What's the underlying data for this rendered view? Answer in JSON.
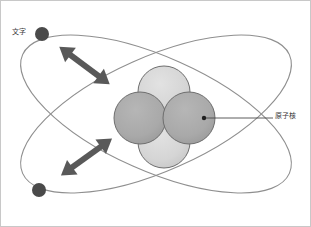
{
  "figure": {
    "background_color": "#ffffff",
    "frame_color": "#c8c8c8",
    "width": 311,
    "height": 227
  },
  "labels": {
    "electron": {
      "text": "文字",
      "semantic": "electron-label",
      "color": "#3a3a3a",
      "x": 11,
      "y": 27
    },
    "nucleus": {
      "text": "原子核",
      "semantic": "nucleus-label",
      "color": "#3a3a3a",
      "x": 274,
      "y": 111
    }
  },
  "colors": {
    "orbit_stroke": "#8f8f8f",
    "nucleus_light": "#d6d6d6",
    "nucleus_dark": "#a9a9a9",
    "nucleus_outline": "#6e6e6e",
    "electron_fill": "#4a4a4a",
    "arrow_fill": "#595959",
    "leader_line": "#4a4a4a"
  },
  "orbits": [
    {
      "name": "orbit-a",
      "cx": 155,
      "cy": 113,
      "rx": 146,
      "ry": 58,
      "rotation": 24,
      "stroke": "#8f8f8f",
      "stroke_width": 1.1
    },
    {
      "name": "orbit-b",
      "cx": 155,
      "cy": 113,
      "rx": 146,
      "ry": 58,
      "rotation": -24,
      "stroke": "#8f8f8f",
      "stroke_width": 1.1
    }
  ],
  "nucleus": {
    "center_x": 163,
    "center_y": 114,
    "particles": [
      {
        "name": "proton-top",
        "cx": 163,
        "cy": 91,
        "r": 26,
        "fill": "#d6d6d6",
        "kind": "light"
      },
      {
        "name": "neutron-left",
        "cx": 139,
        "cy": 117,
        "r": 26,
        "fill": "#a9a9a9",
        "kind": "dark"
      },
      {
        "name": "neutron-right",
        "cx": 188,
        "cy": 117,
        "r": 26,
        "fill": "#a9a9a9",
        "kind": "dark"
      },
      {
        "name": "proton-bottom",
        "cx": 163,
        "cy": 140,
        "r": 26,
        "fill": "#d6d6d6",
        "kind": "light"
      }
    ]
  },
  "electrons": [
    {
      "name": "electron-upper",
      "cx": 41,
      "cy": 33,
      "r": 7,
      "fill": "#4a4a4a"
    },
    {
      "name": "electron-lower",
      "cx": 38,
      "cy": 189,
      "r": 7,
      "fill": "#4a4a4a"
    }
  ],
  "arrows": [
    {
      "name": "motion-arrow-upper",
      "x1": 112,
      "y1": 85,
      "x2": 56,
      "y2": 43,
      "fill": "#595959",
      "double_headed": true
    },
    {
      "name": "motion-arrow-lower",
      "x1": 55,
      "y1": 177,
      "x2": 115,
      "y2": 135,
      "fill": "#595959",
      "double_headed": true
    }
  ],
  "leader": {
    "name": "nucleus-leader-line",
    "x1": 203,
    "y1": 117,
    "x2": 272,
    "y2": 117,
    "stroke": "#4a4a4a",
    "dot_r": 2.2
  }
}
